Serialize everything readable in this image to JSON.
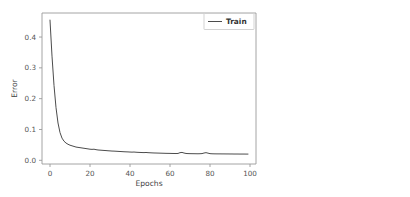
{
  "chart_data": {
    "type": "line",
    "title": "",
    "xlabel": "Epochs",
    "ylabel": "Error",
    "xlim": [
      -4,
      103
    ],
    "ylim": [
      -0.012,
      0.478
    ],
    "grid": false,
    "legend_position": "upper right",
    "xticks": [
      "0",
      "20",
      "40",
      "60",
      "80",
      "100"
    ],
    "xtick_values": [
      0,
      20,
      40,
      60,
      80,
      100
    ],
    "yticks": [
      "0.0",
      "0.1",
      "0.2",
      "0.3",
      "0.4"
    ],
    "ytick_values": [
      0.0,
      0.1,
      0.2,
      0.3,
      0.4
    ],
    "series": [
      {
        "name": "Train",
        "color": "#4c4c4c",
        "x": [
          0,
          1,
          2,
          3,
          4,
          5,
          6,
          7,
          8,
          9,
          10,
          11,
          12,
          13,
          14,
          15,
          16,
          17,
          18,
          19,
          20,
          21,
          22,
          23,
          24,
          25,
          26,
          27,
          28,
          29,
          30,
          31,
          32,
          33,
          34,
          35,
          36,
          37,
          38,
          39,
          40,
          41,
          42,
          43,
          44,
          45,
          46,
          47,
          48,
          49,
          50,
          51,
          52,
          53,
          54,
          55,
          56,
          57,
          58,
          59,
          60,
          61,
          62,
          63,
          64,
          65,
          66,
          67,
          68,
          69,
          70,
          71,
          72,
          73,
          74,
          75,
          76,
          77,
          78,
          79,
          80,
          81,
          82,
          83,
          84,
          85,
          86,
          87,
          88,
          89,
          90,
          91,
          92,
          93,
          94,
          95,
          96,
          97,
          98,
          99
        ],
        "values": [
          0.455,
          0.338,
          0.243,
          0.171,
          0.121,
          0.09,
          0.072,
          0.062,
          0.056,
          0.052,
          0.049,
          0.047,
          0.045,
          0.043,
          0.042,
          0.041,
          0.04,
          0.039,
          0.038,
          0.037,
          0.036,
          0.0355,
          0.036,
          0.0345,
          0.0335,
          0.033,
          0.0325,
          0.032,
          0.0315,
          0.031,
          0.0305,
          0.03,
          0.0298,
          0.0294,
          0.029,
          0.0286,
          0.0282,
          0.0278,
          0.0275,
          0.0272,
          0.0268,
          0.0265,
          0.0268,
          0.0262,
          0.0258,
          0.0255,
          0.0252,
          0.025,
          0.0254,
          0.0248,
          0.0244,
          0.0241,
          0.0238,
          0.0236,
          0.0234,
          0.0232,
          0.023,
          0.0228,
          0.0226,
          0.0225,
          0.0224,
          0.0222,
          0.0221,
          0.022,
          0.0222,
          0.0248,
          0.0256,
          0.0236,
          0.0222,
          0.0218,
          0.0216,
          0.0215,
          0.0214,
          0.0213,
          0.0212,
          0.0214,
          0.0218,
          0.0236,
          0.0248,
          0.0232,
          0.0216,
          0.0212,
          0.021,
          0.0209,
          0.0208,
          0.0208,
          0.0207,
          0.0207,
          0.0206,
          0.0206,
          0.0205,
          0.0205,
          0.0204,
          0.0204,
          0.0204,
          0.0203,
          0.0203,
          0.0203,
          0.0202,
          0.0202
        ]
      }
    ]
  },
  "legend": {
    "entries": [
      {
        "label": "Train",
        "color": "#4c4c4c"
      }
    ]
  },
  "axes": {
    "x_title": "Epochs",
    "y_title": "Error"
  }
}
